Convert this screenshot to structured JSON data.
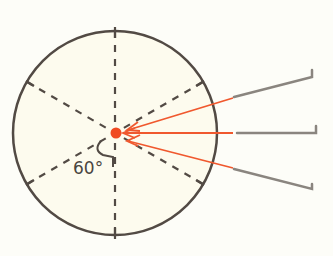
{
  "diagram": {
    "angle_label": "60°",
    "colors": {
      "background": "#fdfdf8",
      "circle_fill": "#fdfbee",
      "circle_stroke": "#524a44",
      "dashed_lines": "#524a44",
      "center_point": "#f04a22",
      "arrows": "#f0582e",
      "pointers": "#8a857f"
    },
    "circle": {
      "cx": 115,
      "cy": 133,
      "r": 102
    },
    "center_point": {
      "cx": 116,
      "cy": 133,
      "r": 5.5
    },
    "pointers_count": 3
  }
}
